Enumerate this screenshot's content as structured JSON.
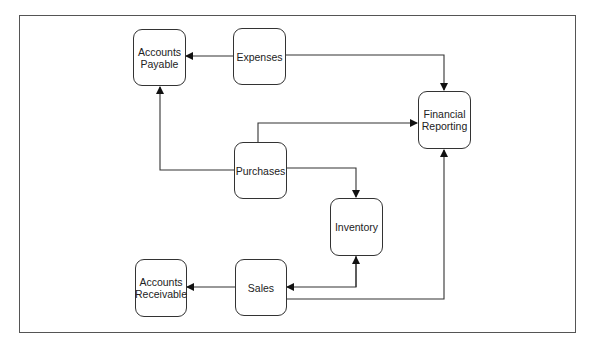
{
  "diagram": {
    "type": "flowchart",
    "nodes": {
      "accounts_payable": {
        "line1": "Accounts",
        "line2": "Payable"
      },
      "expenses": {
        "label": "Expenses"
      },
      "financial_reporting": {
        "line1": "Financial",
        "line2": "Reporting"
      },
      "purchases": {
        "label": "Purchases"
      },
      "inventory": {
        "label": "Inventory"
      },
      "accounts_receivable": {
        "line1": "Accounts",
        "line2": "Receivable"
      },
      "sales": {
        "label": "Sales"
      }
    },
    "edges": [
      {
        "from": "Expenses",
        "to": "Accounts Payable"
      },
      {
        "from": "Expenses",
        "to": "Financial Reporting"
      },
      {
        "from": "Purchases",
        "to": "Accounts Payable"
      },
      {
        "from": "Purchases",
        "to": "Financial Reporting"
      },
      {
        "from": "Purchases",
        "to": "Inventory"
      },
      {
        "from": "Inventory",
        "to": "Sales",
        "bidirectional": true
      },
      {
        "from": "Sales",
        "to": "Accounts Receivable"
      },
      {
        "from": "Sales",
        "to": "Financial Reporting"
      }
    ],
    "colors": {
      "line": "#333333",
      "border": "#555555",
      "background": "#ffffff"
    }
  }
}
